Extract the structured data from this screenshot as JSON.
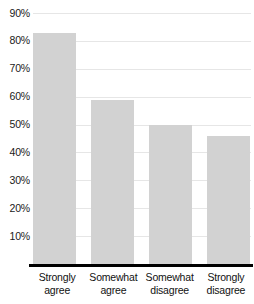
{
  "chart_data": {
    "type": "bar",
    "title": "",
    "subtitle": "",
    "xlabel": "",
    "ylabel": "",
    "categories": [
      "Strongly agree",
      "Somewhat agree",
      "Somewhat disagree",
      "Strongly disagree"
    ],
    "category_lines": [
      [
        "Strongly",
        "agree"
      ],
      [
        "Somewhat",
        "agree"
      ],
      [
        "Somewhat",
        "disagree"
      ],
      [
        "Strongly",
        "disagree"
      ]
    ],
    "values": [
      83,
      59,
      50,
      46
    ],
    "value_labels": [
      "83%",
      "59%",
      "50%",
      "46%"
    ],
    "ylim": [
      0,
      90
    ],
    "ytick_values": [
      10,
      20,
      30,
      40,
      50,
      60,
      70,
      80,
      90
    ],
    "ytick_labels": [
      "10%",
      "20%",
      "30%",
      "40%",
      "50%",
      "60%",
      "70%",
      "80%",
      "90%"
    ],
    "grid": true,
    "grid_axis": "y",
    "legend": false,
    "legend_position": "none",
    "series": [
      {
        "name": "Percent",
        "values": [
          83,
          59,
          50,
          46
        ]
      }
    ],
    "colors": {
      "bar_fill": "#d2d2d2",
      "gridline": "#e6e6e6",
      "axis": "#000000",
      "text": "#111111",
      "background": "#ffffff"
    }
  }
}
